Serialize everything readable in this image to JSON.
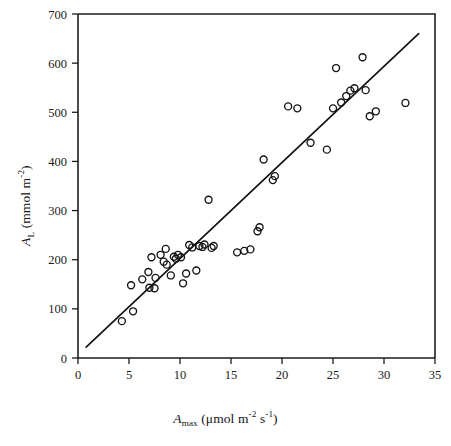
{
  "chart_data": {
    "type": "scatter",
    "title": "",
    "xlabel": "A_max (umol m-2 s-1)",
    "ylabel": "A_L (mmol m-2)",
    "xlim": [
      0,
      35
    ],
    "ylim": [
      0,
      700
    ],
    "xticks": [
      0,
      5,
      10,
      15,
      20,
      25,
      30,
      35
    ],
    "yticks": [
      0,
      100,
      200,
      300,
      400,
      500,
      600,
      700
    ],
    "grid": false,
    "legend": "none",
    "marker_style": "open-circle",
    "series": [
      {
        "name": "A_L vs A_max",
        "points": [
          [
            4.3,
            75
          ],
          [
            5.2,
            148
          ],
          [
            5.4,
            95
          ],
          [
            6.3,
            160
          ],
          [
            6.9,
            175
          ],
          [
            7.0,
            143
          ],
          [
            7.2,
            205
          ],
          [
            7.5,
            142
          ],
          [
            7.6,
            163
          ],
          [
            8.1,
            210
          ],
          [
            8.4,
            196
          ],
          [
            8.6,
            222
          ],
          [
            8.7,
            190
          ],
          [
            9.1,
            168
          ],
          [
            9.4,
            206
          ],
          [
            9.6,
            202
          ],
          [
            9.8,
            210
          ],
          [
            10.1,
            205
          ],
          [
            10.3,
            152
          ],
          [
            10.6,
            172
          ],
          [
            10.9,
            230
          ],
          [
            11.2,
            225
          ],
          [
            11.6,
            178
          ],
          [
            11.9,
            228
          ],
          [
            12.2,
            226
          ],
          [
            12.4,
            231
          ],
          [
            12.8,
            322
          ],
          [
            13.1,
            224
          ],
          [
            13.3,
            228
          ],
          [
            15.6,
            215
          ],
          [
            16.3,
            218
          ],
          [
            16.9,
            221
          ],
          [
            17.6,
            258
          ],
          [
            17.8,
            266
          ],
          [
            18.2,
            404
          ],
          [
            19.1,
            362
          ],
          [
            19.3,
            370
          ],
          [
            20.6,
            512
          ],
          [
            21.5,
            508
          ],
          [
            22.8,
            438
          ],
          [
            24.4,
            424
          ],
          [
            25.0,
            508
          ],
          [
            25.3,
            590
          ],
          [
            25.8,
            520
          ],
          [
            26.3,
            533
          ],
          [
            26.7,
            544
          ],
          [
            27.1,
            549
          ],
          [
            27.9,
            612
          ],
          [
            28.2,
            545
          ],
          [
            28.6,
            492
          ],
          [
            29.2,
            502
          ],
          [
            32.1,
            519
          ]
        ]
      }
    ],
    "fit_line": {
      "type": "linear-regression",
      "x_start": 0.8,
      "y_start": 22,
      "x_end": 33.4,
      "y_end": 660
    }
  },
  "axis_titles": {
    "x": {
      "symbol": "A",
      "subscript": "max",
      "units_open": " (",
      "mu": "μ",
      "units_main": "mol m",
      "units_sup1": "-2",
      "units_mid": " s",
      "units_sup2": "-1",
      "units_close": ")"
    },
    "y": {
      "symbol": "A",
      "subscript": "L",
      "units_open": " (mmol m",
      "units_sup1": "-2",
      "units_close": ")"
    }
  }
}
